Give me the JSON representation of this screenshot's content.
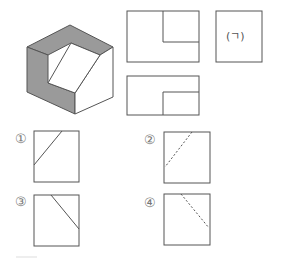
{
  "figure": {
    "type": "orthographic-projection-question",
    "isometric_object": {
      "description": "stepped block with inclined face, gray shaded faces"
    },
    "views": {
      "front_view": {
        "description": "rectangle with upper-right notch"
      },
      "side_view": {
        "label": "(ㄱ)",
        "description": "blank square to be determined"
      },
      "top_view": {
        "description": "rectangle with lower-right inner rectangle"
      }
    },
    "colors": {
      "line": "#555555",
      "shade": "#999999",
      "face": "#ffffff"
    }
  },
  "options": [
    {
      "label": "①",
      "line": "solid",
      "direction": "rising"
    },
    {
      "label": "②",
      "line": "dashed",
      "direction": "rising"
    },
    {
      "label": "③",
      "line": "solid",
      "direction": "falling"
    },
    {
      "label": "④",
      "line": "dashed",
      "direction": "falling"
    }
  ]
}
